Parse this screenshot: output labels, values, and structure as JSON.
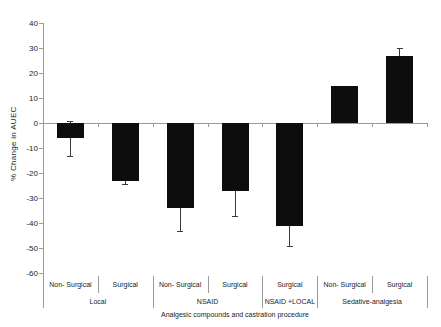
{
  "chart_data": {
    "type": "bar",
    "title": "",
    "ylabel": "% Change in AUEC",
    "xlabel": "Analgesic compounds and castration procedure",
    "ylim": [
      -60,
      40
    ],
    "yticks": [
      40,
      30,
      20,
      10,
      0,
      -10,
      -20,
      -30,
      -40,
      -50,
      -60
    ],
    "legend": "none",
    "grid": "off",
    "colors": {
      "bar": "#0d0d0d",
      "axis_line": "#9a9a9a",
      "error_bar": "#3a3a3a",
      "text": "#222222",
      "background": "#ffffff"
    },
    "groups": [
      {
        "label": "Local",
        "bars": [
          {
            "label": "Non- Surgical",
            "value": -6,
            "error": 7
          },
          {
            "label": "Surgical",
            "value": -23,
            "error": 1.5
          }
        ]
      },
      {
        "label": "NSAID",
        "bars": [
          {
            "label": "Non- Surgical",
            "value": -34,
            "error": 9
          },
          {
            "label": "Surgical",
            "value": -27,
            "error": 10
          }
        ]
      },
      {
        "label": "NSAID +LOCAL",
        "bars": [
          {
            "label": "Surgical",
            "value": -41,
            "error": 8
          }
        ]
      },
      {
        "label": "Sedative-analgesia",
        "bars": [
          {
            "label": "Non- Surgical",
            "value": 15,
            "error": 0
          },
          {
            "label": "Surgical",
            "value": 27,
            "error": 3
          }
        ]
      }
    ]
  }
}
